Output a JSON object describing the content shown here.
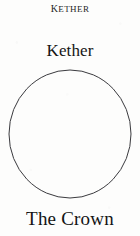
{
  "page": {
    "background_color": "#fdfdfc",
    "ink_color": "#1c1c1c",
    "width": 140,
    "height": 236
  },
  "running_head": {
    "text": "Kether",
    "style": "small-caps"
  },
  "sephira": {
    "name": "Kether",
    "translation": "The Crown"
  },
  "diagram": {
    "shape_name": "circle",
    "stroke_color": "#3a3a3e",
    "stroke_width": 1,
    "fill": "none",
    "center_x": 62,
    "center_y": 65,
    "radius_x": 61,
    "radius_y": 64
  }
}
